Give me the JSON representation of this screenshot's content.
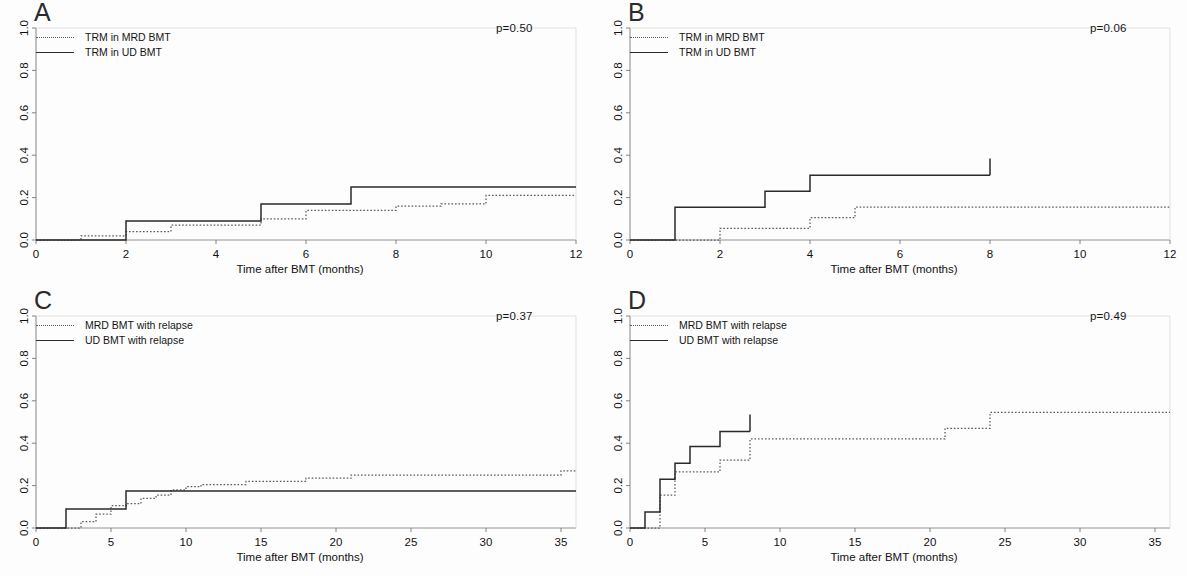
{
  "figure": {
    "panel_count": 4
  },
  "common": {
    "xlabel": "Time after BMT (months)",
    "ylabel": "",
    "ylim": [
      0,
      1
    ],
    "yticks": [
      0.0,
      0.2,
      0.4,
      0.6,
      0.8,
      1.0
    ],
    "ytick_labels": [
      "0.0",
      "0.2",
      "0.4",
      "0.6",
      "0.8",
      "1.0"
    ],
    "grid": false,
    "legend_position": "top-left",
    "dotted_color": "#5a5a5a",
    "solid_color": "#2a2a2a"
  },
  "panels": [
    {
      "id": "A",
      "letter": "A",
      "pvalue_label": "p=0.50",
      "xlabel": "Time after BMT (months)",
      "xlim": [
        0,
        12
      ],
      "xticks": [
        0,
        2,
        4,
        6,
        8,
        10,
        12
      ],
      "xtick_labels": [
        "0",
        "2",
        "4",
        "6",
        "8",
        "10",
        "12"
      ],
      "legend": [
        {
          "label": "TRM in MRD BMT",
          "style": "dotted"
        },
        {
          "label": "TRM in UD BMT",
          "style": "solid"
        }
      ]
    },
    {
      "id": "B",
      "letter": "B",
      "pvalue_label": "p=0.06",
      "xlabel": "Time after BMT (months)",
      "xlim": [
        0,
        12
      ],
      "xticks": [
        0,
        2,
        4,
        6,
        8,
        10,
        12
      ],
      "xtick_labels": [
        "0",
        "2",
        "4",
        "6",
        "8",
        "10",
        "12"
      ],
      "legend": [
        {
          "label": "TRM in MRD BMT",
          "style": "dotted"
        },
        {
          "label": "TRM in UD BMT",
          "style": "solid"
        }
      ]
    },
    {
      "id": "C",
      "letter": "C",
      "pvalue_label": "p=0.37",
      "xlabel": "Time after BMT (months)",
      "xlim": [
        0,
        36
      ],
      "xticks": [
        0,
        5,
        10,
        15,
        20,
        25,
        30,
        35
      ],
      "xtick_labels": [
        "0",
        "5",
        "10",
        "15",
        "20",
        "25",
        "30",
        "35"
      ],
      "legend": [
        {
          "label": "MRD BMT with relapse",
          "style": "dotted"
        },
        {
          "label": "UD BMT with relapse",
          "style": "solid"
        }
      ]
    },
    {
      "id": "D",
      "letter": "D",
      "pvalue_label": "p=0.49",
      "xlabel": "Time after BMT (months)",
      "xlim": [
        0,
        36
      ],
      "xticks": [
        0,
        5,
        10,
        15,
        20,
        25,
        30,
        35
      ],
      "xtick_labels": [
        "0",
        "5",
        "10",
        "15",
        "20",
        "25",
        "30",
        "35"
      ],
      "legend": [
        {
          "label": "MRD BMT with relapse",
          "style": "dotted"
        },
        {
          "label": "UD BMT with relapse",
          "style": "solid"
        }
      ]
    }
  ],
  "chart_data": [
    {
      "panel": "A",
      "type": "line",
      "subtype": "step",
      "title": "A",
      "xlabel": "Time after BMT (months)",
      "ylabel": "",
      "xlim": [
        0,
        12
      ],
      "ylim": [
        0,
        1
      ],
      "xticks": [
        0,
        2,
        4,
        6,
        8,
        10,
        12
      ],
      "yticks": [
        0.0,
        0.2,
        0.4,
        0.6,
        0.8,
        1.0
      ],
      "grid": false,
      "legend_position": "top-left",
      "annotations": [
        "p=0.50"
      ],
      "series": [
        {
          "name": "TRM in MRD BMT",
          "style": "dotted",
          "x": [
            0,
            1,
            2,
            3,
            5,
            6,
            8,
            9,
            10,
            12
          ],
          "y": [
            0.0,
            0.02,
            0.04,
            0.07,
            0.1,
            0.14,
            0.16,
            0.17,
            0.21,
            0.21
          ]
        },
        {
          "name": "TRM in UD BMT",
          "style": "solid",
          "x": [
            0,
            2,
            5,
            7,
            12
          ],
          "y": [
            0.0,
            0.09,
            0.17,
            0.25,
            0.25
          ]
        }
      ]
    },
    {
      "panel": "B",
      "type": "line",
      "subtype": "step",
      "title": "B",
      "xlabel": "Time after BMT (months)",
      "ylabel": "",
      "xlim": [
        0,
        12
      ],
      "ylim": [
        0,
        1
      ],
      "xticks": [
        0,
        2,
        4,
        6,
        8,
        10,
        12
      ],
      "yticks": [
        0.0,
        0.2,
        0.4,
        0.6,
        0.8,
        1.0
      ],
      "grid": false,
      "legend_position": "top-left",
      "annotations": [
        "p=0.06"
      ],
      "series": [
        {
          "name": "TRM in MRD BMT",
          "style": "dotted",
          "x": [
            0,
            2,
            4,
            5,
            12
          ],
          "y": [
            0.0,
            0.055,
            0.105,
            0.155,
            0.155
          ]
        },
        {
          "name": "TRM in UD BMT",
          "style": "solid",
          "x": [
            0,
            1,
            3,
            4,
            8
          ],
          "y": [
            0.0,
            0.155,
            0.23,
            0.305,
            0.305
          ],
          "censor_marks": [
            {
              "x": 8,
              "y": 0.385
            }
          ]
        }
      ]
    },
    {
      "panel": "C",
      "type": "line",
      "subtype": "step",
      "title": "C",
      "xlabel": "Time after BMT (months)",
      "ylabel": "",
      "xlim": [
        0,
        36
      ],
      "ylim": [
        0,
        1
      ],
      "xticks": [
        0,
        5,
        10,
        15,
        20,
        25,
        30,
        35
      ],
      "yticks": [
        0.0,
        0.2,
        0.4,
        0.6,
        0.8,
        1.0
      ],
      "grid": false,
      "legend_position": "top-left",
      "annotations": [
        "p=0.37"
      ],
      "series": [
        {
          "name": "MRD BMT with relapse",
          "style": "dotted",
          "x": [
            0,
            3,
            4,
            5,
            6,
            7,
            8,
            9,
            10,
            11,
            14,
            18,
            21,
            35,
            36
          ],
          "y": [
            0.0,
            0.03,
            0.065,
            0.105,
            0.115,
            0.14,
            0.155,
            0.18,
            0.195,
            0.205,
            0.22,
            0.235,
            0.25,
            0.27,
            0.27
          ]
        },
        {
          "name": "UD BMT with relapse",
          "style": "solid",
          "x": [
            0,
            2,
            6,
            36
          ],
          "y": [
            0.0,
            0.09,
            0.175,
            0.175
          ]
        }
      ]
    },
    {
      "panel": "D",
      "type": "line",
      "subtype": "step",
      "title": "D",
      "xlabel": "Time after BMT (months)",
      "ylabel": "",
      "xlim": [
        0,
        36
      ],
      "ylim": [
        0,
        1
      ],
      "xticks": [
        0,
        5,
        10,
        15,
        20,
        25,
        30,
        35
      ],
      "yticks": [
        0.0,
        0.2,
        0.4,
        0.6,
        0.8,
        1.0
      ],
      "grid": false,
      "legend_position": "top-left",
      "annotations": [
        "p=0.49"
      ],
      "series": [
        {
          "name": "MRD BMT with relapse",
          "style": "dotted",
          "x": [
            0,
            2,
            3,
            6,
            8,
            21,
            24,
            36
          ],
          "y": [
            0.0,
            0.155,
            0.265,
            0.32,
            0.42,
            0.47,
            0.545,
            0.545
          ]
        },
        {
          "name": "UD BMT with relapse",
          "style": "solid",
          "x": [
            0,
            1,
            2,
            3,
            4,
            6,
            8
          ],
          "y": [
            0.0,
            0.075,
            0.23,
            0.305,
            0.385,
            0.455,
            0.455
          ],
          "censor_marks": [
            {
              "x": 8,
              "y": 0.535
            }
          ]
        }
      ]
    }
  ]
}
